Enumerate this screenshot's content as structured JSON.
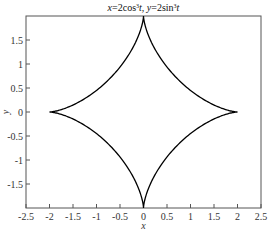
{
  "chart_data": {
    "type": "line",
    "title_parts": [
      {
        "text": "x",
        "italic": true
      },
      {
        "text": "=2cos",
        "italic": false
      },
      {
        "text": "3",
        "sup": true
      },
      {
        "text": "t",
        "italic": true
      },
      {
        "text": ", ",
        "italic": false
      },
      {
        "text": "y",
        "italic": true
      },
      {
        "text": "=2sin",
        "italic": false
      },
      {
        "text": "3",
        "sup": true
      },
      {
        "text": "t",
        "italic": true
      }
    ],
    "xlabel": "x",
    "ylabel": "y",
    "xlim": [
      -2.5,
      2.5
    ],
    "ylim": [
      -2,
      2
    ],
    "xticks": [
      -2.5,
      -2,
      -1.5,
      -1,
      -0.5,
      0,
      0.5,
      1,
      1.5,
      2,
      2.5
    ],
    "xtick_labels": [
      "-2.5",
      "-2",
      "-1.5",
      "-1",
      "-0.5",
      "0",
      "0.5",
      "1",
      "1.5",
      "2",
      "2.5"
    ],
    "yticks": [
      -1.5,
      -1,
      -0.5,
      0,
      0.5,
      1,
      1.5
    ],
    "ytick_labels": [
      "-1.5",
      "-1",
      "-0.5",
      "0",
      "0.5",
      "1",
      "1.5"
    ],
    "grid": false,
    "legend": null,
    "series": [
      {
        "name": "astroid",
        "equation": {
          "x": "2cos^3(t)",
          "y": "2sin^3(t)"
        },
        "parameter_range": [
          0,
          6.2832
        ],
        "color": "#000000",
        "cusps": [
          [
            2,
            0
          ],
          [
            0,
            2
          ],
          [
            -2,
            0
          ],
          [
            0,
            -2
          ]
        ]
      }
    ]
  },
  "layout": {
    "plot_left": 26,
    "plot_right": 261,
    "plot_top": 16,
    "plot_bottom": 208
  }
}
